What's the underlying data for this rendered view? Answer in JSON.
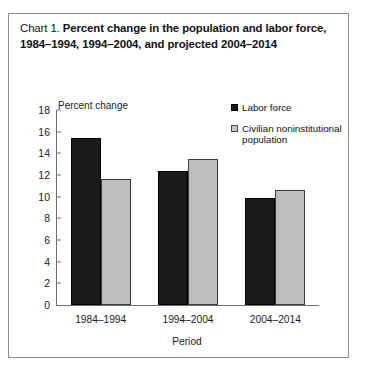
{
  "figure": {
    "title_label": "Chart 1.",
    "title_main": "Percent change in the population and labor force, 1984–1994, 1994–2004, and projected 2004–2014",
    "axis_unit_label": "Percent change"
  },
  "chart_data": {
    "type": "bar",
    "title": "Chart 1.  Percent change in the population and labor force, 1984–1994, 1994–2004, and projected 2004–2014",
    "categories": [
      "1984–1994",
      "1994–2004",
      "2004–2014"
    ],
    "series": [
      {
        "name": "Labor force",
        "values": [
          15.4,
          12.4,
          9.9
        ],
        "color": "#1b1b1b"
      },
      {
        "name": "Civilian noninstitutional population",
        "values": [
          11.6,
          13.5,
          10.6
        ],
        "color": "#bdbdbd"
      }
    ],
    "xlabel": "Period",
    "ylabel": "Percent change",
    "ylim": [
      0,
      18
    ],
    "yticks": [
      0,
      2,
      4,
      6,
      8,
      10,
      12,
      14,
      16,
      18
    ],
    "grid": false,
    "legend_position": "top-right"
  }
}
